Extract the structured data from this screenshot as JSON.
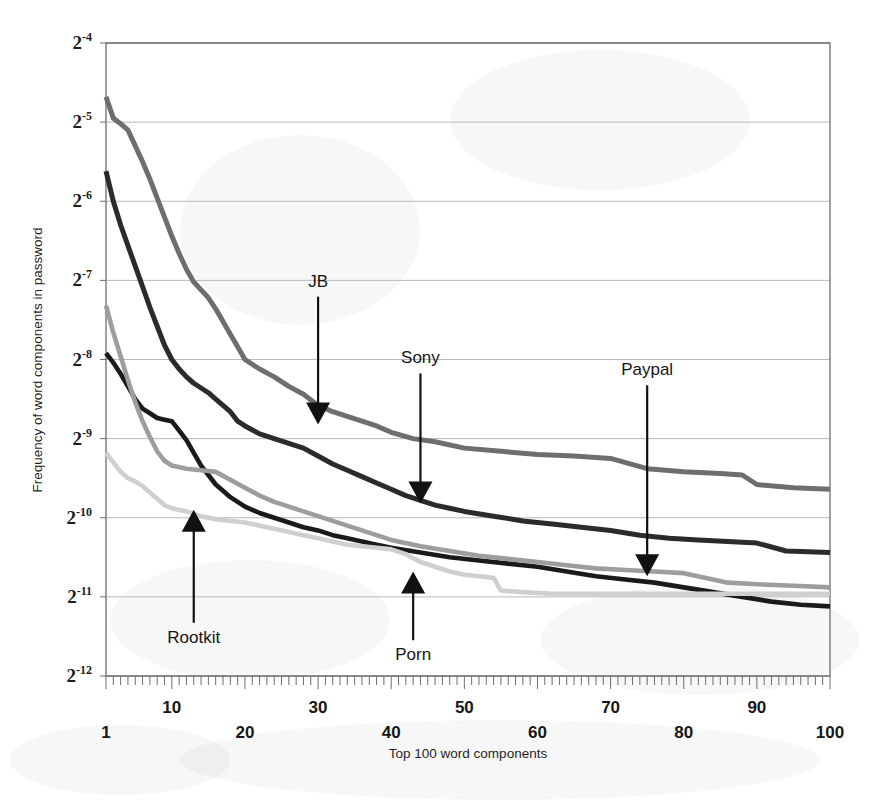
{
  "chart_data": {
    "type": "line",
    "title": "",
    "xlabel": "Top 100 word components",
    "ylabel": "Frequency of word components in password",
    "xlim": [
      1,
      100
    ],
    "ylim": [
      -12,
      -4
    ],
    "yscale": "log2",
    "grid": true,
    "legend_position": "none-inline-annotations",
    "y_tick_labels": [
      "2⁻⁴",
      "2⁻⁵",
      "2⁻⁶",
      "2⁻⁷",
      "2⁻⁸",
      "2⁻⁹",
      "2⁻¹⁰",
      "2⁻¹¹",
      "2⁻¹²"
    ],
    "y_tick_bases": [
      "2",
      "2",
      "2",
      "2",
      "2",
      "2",
      "2",
      "2",
      "2"
    ],
    "y_tick_exponents": [
      "-4",
      "-5",
      "-6",
      "-7",
      "-8",
      "-9",
      "-10",
      "-11",
      "-12"
    ],
    "y_tick_values": [
      -4,
      -5,
      -6,
      -7,
      -8,
      -9,
      -10,
      -11,
      -12
    ],
    "x_tick_labels": [
      "1",
      "10",
      "20",
      "30",
      "40",
      "50",
      "60",
      "70",
      "80",
      "90",
      "100"
    ],
    "x_tick_values": [
      1,
      10,
      20,
      30,
      40,
      50,
      60,
      70,
      80,
      90,
      100
    ],
    "x_tick_rows": [
      1,
      0,
      1,
      0,
      1,
      0,
      1,
      0,
      1,
      0,
      1
    ],
    "x_minor_tick_step": 1,
    "colors": {
      "jb": "#6e6e6e",
      "sony": "#2b2b2b",
      "rootkit": "#1a1a1a",
      "paypal": "#9d9d9d",
      "porn": "#cfcfcf"
    },
    "series": [
      {
        "name": "JB",
        "key": "jb",
        "color": "#6e6e6e",
        "width": 5.0,
        "x": [
          1,
          2,
          3,
          4,
          5,
          6,
          7,
          8,
          9,
          10,
          11,
          12,
          13,
          14,
          15,
          16,
          17,
          18,
          19,
          20,
          22,
          24,
          26,
          28,
          30,
          32,
          34,
          36,
          38,
          40,
          43,
          46,
          50,
          55,
          60,
          65,
          70,
          75,
          80,
          85,
          88,
          90,
          95,
          100
        ],
        "y": [
          -4.68,
          -4.95,
          -5.02,
          -5.1,
          -5.3,
          -5.5,
          -5.72,
          -5.96,
          -6.2,
          -6.44,
          -6.66,
          -6.86,
          -7.02,
          -7.12,
          -7.22,
          -7.36,
          -7.52,
          -7.68,
          -7.84,
          -8.0,
          -8.12,
          -8.22,
          -8.34,
          -8.44,
          -8.58,
          -8.66,
          -8.72,
          -8.78,
          -8.84,
          -8.92,
          -9.0,
          -9.04,
          -9.12,
          -9.16,
          -9.2,
          -9.22,
          -9.25,
          -9.38,
          -9.42,
          -9.44,
          -9.46,
          -9.58,
          -9.62,
          -9.64
        ]
      },
      {
        "name": "Sony",
        "key": "sony",
        "color": "#2b2b2b",
        "width": 5.0,
        "x": [
          1,
          2,
          3,
          4,
          5,
          6,
          7,
          8,
          9,
          10,
          11,
          12,
          13,
          14,
          15,
          16,
          17,
          18,
          19,
          20,
          22,
          24,
          26,
          28,
          30,
          32,
          34,
          36,
          38,
          40,
          42,
          44,
          46,
          48,
          50,
          54,
          58,
          62,
          66,
          70,
          74,
          78,
          82,
          86,
          90,
          94,
          100
        ],
        "y": [
          -5.62,
          -6.0,
          -6.3,
          -6.56,
          -6.82,
          -7.08,
          -7.34,
          -7.58,
          -7.82,
          -8.0,
          -8.12,
          -8.22,
          -8.3,
          -8.36,
          -8.42,
          -8.5,
          -8.58,
          -8.66,
          -8.78,
          -8.84,
          -8.94,
          -9.0,
          -9.06,
          -9.12,
          -9.22,
          -9.32,
          -9.4,
          -9.48,
          -9.56,
          -9.64,
          -9.72,
          -9.78,
          -9.84,
          -9.88,
          -9.92,
          -9.98,
          -10.04,
          -10.08,
          -10.12,
          -10.16,
          -10.22,
          -10.26,
          -10.28,
          -10.3,
          -10.32,
          -10.42,
          -10.44
        ]
      },
      {
        "name": "Rootkit",
        "key": "rootkit",
        "color": "#1a1a1a",
        "width": 4.6,
        "x": [
          1,
          2,
          3,
          4,
          5,
          6,
          7,
          8,
          9,
          10,
          11,
          12,
          13,
          14,
          15,
          16,
          17,
          18,
          20,
          22,
          24,
          26,
          28,
          30,
          32,
          34,
          36,
          38,
          40,
          44,
          48,
          52,
          56,
          60,
          64,
          68,
          72,
          76,
          80,
          84,
          88,
          92,
          96,
          100
        ],
        "y": [
          -7.92,
          -8.04,
          -8.18,
          -8.34,
          -8.5,
          -8.62,
          -8.68,
          -8.74,
          -8.76,
          -8.78,
          -8.9,
          -9.02,
          -9.18,
          -9.34,
          -9.46,
          -9.58,
          -9.66,
          -9.74,
          -9.86,
          -9.94,
          -10.0,
          -10.06,
          -10.12,
          -10.16,
          -10.22,
          -10.26,
          -10.3,
          -10.34,
          -10.38,
          -10.44,
          -10.5,
          -10.54,
          -10.58,
          -10.62,
          -10.68,
          -10.74,
          -10.78,
          -10.82,
          -10.88,
          -10.94,
          -11.0,
          -11.06,
          -11.1,
          -11.12
        ]
      },
      {
        "name": "Paypal",
        "key": "paypal",
        "color": "#9d9d9d",
        "width": 4.6,
        "x": [
          1,
          2,
          3,
          4,
          5,
          6,
          7,
          8,
          9,
          10,
          12,
          14,
          16,
          18,
          20,
          22,
          24,
          26,
          28,
          30,
          32,
          34,
          36,
          38,
          40,
          44,
          48,
          52,
          56,
          60,
          64,
          68,
          72,
          76,
          80,
          84,
          86,
          90,
          95,
          100
        ],
        "y": [
          -7.32,
          -7.66,
          -7.96,
          -8.26,
          -8.54,
          -8.78,
          -8.98,
          -9.16,
          -9.28,
          -9.34,
          -9.38,
          -9.4,
          -9.42,
          -9.52,
          -9.62,
          -9.72,
          -9.8,
          -9.86,
          -9.92,
          -9.98,
          -10.04,
          -10.1,
          -10.16,
          -10.22,
          -10.28,
          -10.36,
          -10.42,
          -10.48,
          -10.52,
          -10.56,
          -10.6,
          -10.64,
          -10.66,
          -10.68,
          -10.7,
          -10.78,
          -10.82,
          -10.84,
          -10.86,
          -10.88
        ]
      },
      {
        "name": "Porn",
        "key": "porn",
        "color": "#cfcfcf",
        "width": 4.6,
        "x": [
          1,
          2,
          3,
          4,
          5,
          6,
          7,
          8,
          9,
          10,
          12,
          14,
          16,
          18,
          20,
          22,
          24,
          26,
          28,
          30,
          32,
          34,
          36,
          38,
          40,
          42,
          44,
          46,
          48,
          50,
          52,
          54,
          55,
          58,
          62,
          66,
          70,
          75,
          80,
          85,
          90,
          95,
          100
        ],
        "y": [
          -9.18,
          -9.3,
          -9.42,
          -9.5,
          -9.54,
          -9.6,
          -9.68,
          -9.76,
          -9.84,
          -9.88,
          -9.92,
          -9.98,
          -10.02,
          -10.04,
          -10.06,
          -10.1,
          -10.14,
          -10.18,
          -10.22,
          -10.26,
          -10.3,
          -10.34,
          -10.36,
          -10.38,
          -10.4,
          -10.46,
          -10.56,
          -10.62,
          -10.68,
          -10.72,
          -10.74,
          -10.76,
          -10.92,
          -10.94,
          -10.96,
          -10.96,
          -10.96,
          -10.96,
          -10.96,
          -10.96,
          -10.96,
          -10.96,
          -10.96
        ]
      }
    ],
    "annotations": [
      {
        "label": "JB",
        "x": 30,
        "y": -8.82,
        "label_x": 30,
        "label_y": -7.08,
        "direction": "down"
      },
      {
        "label": "Sony",
        "x": 44,
        "y": -9.82,
        "label_x": 44,
        "label_y": -8.05,
        "direction": "down"
      },
      {
        "label": "Paypal",
        "x": 75,
        "y": -10.74,
        "label_x": 75,
        "label_y": -8.2,
        "direction": "down"
      },
      {
        "label": "Rootkit",
        "x": 13,
        "y": -9.9,
        "label_x": 13,
        "label_y": -11.58,
        "direction": "up"
      },
      {
        "label": "Porn",
        "x": 43,
        "y": -10.68,
        "label_x": 43,
        "label_y": -11.8,
        "direction": "up"
      }
    ]
  }
}
